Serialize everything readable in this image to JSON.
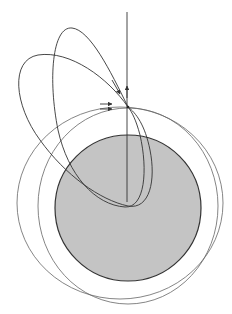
{
  "figure": {
    "colors": {
      "background": "#ffffff",
      "planet_fill": "#c4c4c4",
      "planet_stroke": "#333333",
      "orbit_stroke": "#555555",
      "trajectory_stroke": "#333333"
    },
    "elements": {
      "planet": {
        "cx": 128,
        "cy": 208,
        "r": 73
      },
      "burn_point": {
        "x": 128,
        "y": 107
      },
      "radial_line": {
        "x": 127,
        "y_top": 12,
        "y_bottom": 202
      }
    }
  }
}
